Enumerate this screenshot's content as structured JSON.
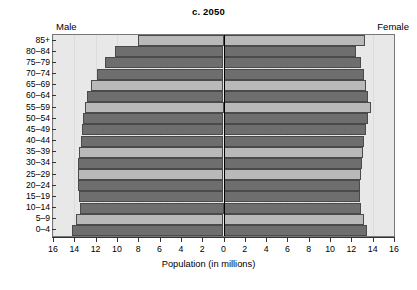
{
  "chart": {
    "title": "c. 2050",
    "male_caption": "Male",
    "female_caption": "Female",
    "xlabel": "Population (in millions)"
  },
  "chart_data": {
    "type": "bar",
    "subtype": "population-pyramid",
    "title": "c. 2050",
    "xlabel": "Population (in millions)",
    "ylabel": "",
    "orientation": "horizontal",
    "grid": true,
    "legend": "none",
    "axis_max": 16,
    "xlim": [
      -16,
      16
    ],
    "xticks": [
      16,
      14,
      12,
      10,
      8,
      6,
      4,
      2,
      0,
      2,
      4,
      6,
      8,
      10,
      12,
      14,
      16
    ],
    "categories": [
      "85+",
      "80-84",
      "75-79",
      "70-74",
      "65-69",
      "60-64",
      "55-59",
      "50-54",
      "45-49",
      "40-44",
      "35-39",
      "30-34",
      "25-29",
      "20-24",
      "15-19",
      "10-14",
      "5-9",
      "0-4"
    ],
    "series": [
      {
        "name": "Male",
        "side": "left",
        "values": [
          8.0,
          10.2,
          11.1,
          11.9,
          12.4,
          12.8,
          13.0,
          13.2,
          13.3,
          13.4,
          13.6,
          13.7,
          13.7,
          13.7,
          13.6,
          13.5,
          13.8,
          14.2
        ]
      },
      {
        "name": "Female",
        "side": "right",
        "values": [
          13.3,
          12.4,
          12.9,
          13.2,
          13.4,
          13.6,
          13.8,
          13.6,
          13.4,
          13.2,
          13.1,
          13.0,
          12.9,
          12.8,
          12.8,
          12.9,
          13.2,
          13.5
        ]
      }
    ],
    "bar_shading": [
      "light",
      "dark",
      "dark",
      "dark",
      "light",
      "dark",
      "light",
      "dark",
      "dark",
      "dark",
      "light",
      "dark",
      "light",
      "dark",
      "dark",
      "dark",
      "light",
      "dark"
    ],
    "colors": {
      "bar_dark": "#6e6e6e",
      "bar_light": "#b9b9b9",
      "bar_border": "#4a4a4a",
      "plot_background": "#e8e8e8",
      "zero_line": "#000000"
    }
  }
}
